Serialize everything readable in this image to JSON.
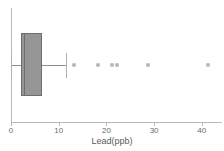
{
  "chart_data": {
    "type": "box",
    "title": "",
    "xlabel": "Lead(ppb)",
    "ylabel": "",
    "orientation": "horizontal",
    "xlim": [
      0,
      44.3
    ],
    "grid": false,
    "legend": false,
    "tick_labels": [
      "0",
      "10",
      "20",
      "30",
      "40"
    ],
    "ticks": [
      0,
      10,
      20,
      30,
      40
    ],
    "series": [
      {
        "name": "Lead(ppb)",
        "whisker_low": 0.0,
        "q1": 2.1,
        "median": 2.7,
        "q3": 6.5,
        "whisker_high": 11.5,
        "outliers": [
          13.2,
          18.2,
          21.2,
          22.2,
          28.7,
          41.3
        ]
      }
    ],
    "colors": {
      "box_fill": "#969696",
      "box_edge": "#6e6e6e",
      "median": "#6e6e6e",
      "whisker": "#8d8d8d",
      "outlier": "#9a9a9a",
      "axis": "#b9b9b9",
      "text": "#5a5a5a"
    }
  }
}
